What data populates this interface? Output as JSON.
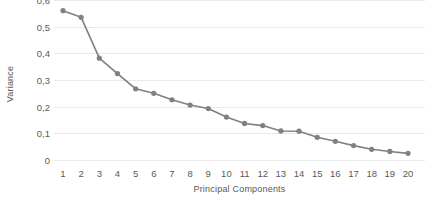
{
  "chart_data": {
    "type": "line",
    "title": "",
    "subtitle": "",
    "xlabel": "Principal Components",
    "ylabel": "Variance",
    "categories": [
      "1",
      "2",
      "3",
      "4",
      "5",
      "6",
      "7",
      "8",
      "9",
      "10",
      "11",
      "12",
      "13",
      "14",
      "15",
      "16",
      "17",
      "18",
      "19",
      "20"
    ],
    "x": [
      1,
      2,
      3,
      4,
      5,
      6,
      7,
      8,
      9,
      10,
      11,
      12,
      13,
      14,
      15,
      16,
      17,
      18,
      19,
      20
    ],
    "values": [
      0.56,
      0.535,
      0.382,
      0.324,
      0.267,
      0.25,
      0.226,
      0.206,
      0.193,
      0.161,
      0.137,
      0.129,
      0.109,
      0.108,
      0.085,
      0.07,
      0.054,
      0.04,
      0.032,
      0.025
    ],
    "series": [
      {
        "name": "Variance",
        "values": [
          0.56,
          0.535,
          0.382,
          0.324,
          0.267,
          0.25,
          0.226,
          0.206,
          0.193,
          0.161,
          0.137,
          0.129,
          0.109,
          0.108,
          0.085,
          0.07,
          0.054,
          0.04,
          0.032,
          0.025
        ]
      }
    ],
    "ylim": [
      0,
      0.6
    ],
    "xlim": [
      1,
      20
    ],
    "ytick_values": [
      0.6,
      0.5,
      0.4,
      0.3,
      0.2,
      0.1,
      0
    ],
    "ytick_labels": [
      "0,6",
      "0,5",
      "0,4",
      "0,3",
      "0,2",
      "0,1",
      "0"
    ],
    "xtick_labels": [
      "1",
      "2",
      "3",
      "4",
      "5",
      "6",
      "7",
      "8",
      "9",
      "10",
      "11",
      "12",
      "13",
      "14",
      "15",
      "16",
      "17",
      "18",
      "19",
      "20"
    ],
    "grid": "horizontal",
    "legend": "none",
    "decimal_separator": ",",
    "marker": "circle",
    "colors": {
      "series": "#808080",
      "marker": "#808080",
      "gridline": "#e9e9e9",
      "text": "#595959",
      "background": "#ffffff"
    }
  }
}
